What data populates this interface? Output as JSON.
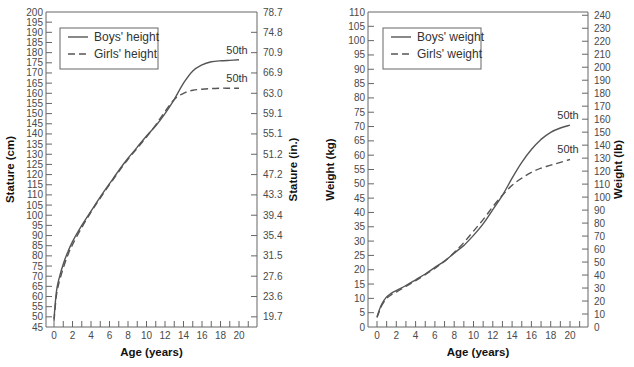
{
  "chart_data": [
    {
      "type": "line",
      "title": "",
      "xlabel": "Age (years)",
      "ylabel": "Stature (cm)",
      "ylabel_right": "Stature (in.)",
      "xlim": [
        0,
        21
      ],
      "ylim": [
        45,
        200
      ],
      "x_ticks": [
        0,
        2,
        4,
        6,
        8,
        10,
        12,
        14,
        16,
        18,
        20
      ],
      "y_ticks": [
        45,
        50,
        55,
        60,
        65,
        70,
        75,
        80,
        85,
        90,
        95,
        100,
        105,
        110,
        115,
        120,
        125,
        130,
        135,
        140,
        145,
        150,
        155,
        160,
        165,
        170,
        175,
        180,
        185,
        190,
        195,
        200
      ],
      "y_ticks_right": [
        {
          "cm": 50,
          "label": "19.7"
        },
        {
          "cm": 60,
          "label": "23.6"
        },
        {
          "cm": 70,
          "label": "27.6"
        },
        {
          "cm": 80,
          "label": "31.5"
        },
        {
          "cm": 90,
          "label": "35.4"
        },
        {
          "cm": 100,
          "label": "39.4"
        },
        {
          "cm": 110,
          "label": "43.3"
        },
        {
          "cm": 120,
          "label": "47.2"
        },
        {
          "cm": 130,
          "label": "51.2"
        },
        {
          "cm": 140,
          "label": "55.1"
        },
        {
          "cm": 150,
          "label": "59.1"
        },
        {
          "cm": 160,
          "label": "63.0"
        },
        {
          "cm": 170,
          "label": "66.9"
        },
        {
          "cm": 180,
          "label": "70.9"
        },
        {
          "cm": 190,
          "label": "74.8"
        },
        {
          "cm": 200,
          "label": "78.7"
        }
      ],
      "legend": {
        "position": "upper left",
        "entries": [
          {
            "label": "Boys' height",
            "style": "solid"
          },
          {
            "label": "Girls' height",
            "style": "dashed"
          }
        ]
      },
      "annotations": [
        {
          "text": "50th",
          "series": "Boys' height"
        },
        {
          "text": "50th",
          "series": "Girls' height"
        }
      ],
      "grid": false,
      "x": [
        0,
        0.25,
        0.5,
        1,
        1.5,
        2,
        3,
        4,
        5,
        6,
        7,
        8,
        9,
        10,
        11,
        12,
        13,
        14,
        15,
        16,
        17,
        18,
        19,
        20
      ],
      "series": [
        {
          "name": "Boys' height",
          "style": "solid",
          "color": "#555555",
          "values": [
            49,
            62,
            68,
            76,
            82,
            87,
            95,
            102,
            109,
            115.5,
            122,
            128,
            133.5,
            139,
            144,
            150,
            157,
            165,
            171,
            174,
            175.5,
            176,
            176.2,
            176.5
          ]
        },
        {
          "name": "Girls' height",
          "style": "dashed",
          "color": "#555555",
          "values": [
            48,
            60,
            66,
            74,
            80.5,
            85.5,
            94,
            101.5,
            108.5,
            115,
            121.5,
            127.5,
            133,
            138.5,
            144.5,
            151,
            157,
            160,
            161.5,
            162,
            162.3,
            162.5,
            162.5,
            162.5
          ]
        }
      ]
    },
    {
      "type": "line",
      "title": "",
      "xlabel": "Age (years)",
      "ylabel": "Weight (kg)",
      "ylabel_right": "Weight (lb)",
      "xlim": [
        0,
        21
      ],
      "ylim": [
        0,
        110
      ],
      "x_ticks": [
        0,
        2,
        4,
        6,
        8,
        10,
        12,
        14,
        16,
        18,
        20
      ],
      "y_ticks": [
        0,
        5,
        10,
        15,
        20,
        25,
        30,
        35,
        40,
        45,
        50,
        55,
        60,
        65,
        70,
        75,
        80,
        85,
        90,
        95,
        100,
        105,
        110
      ],
      "y_ticks_right": [
        0,
        10,
        20,
        30,
        40,
        50,
        60,
        70,
        80,
        90,
        100,
        110,
        120,
        130,
        140,
        150,
        160,
        170,
        180,
        190,
        200,
        210,
        220,
        230,
        240
      ],
      "legend": {
        "position": "upper left",
        "entries": [
          {
            "label": "Boys' weight",
            "style": "solid"
          },
          {
            "label": "Girls' weight",
            "style": "dashed"
          }
        ]
      },
      "annotations": [
        {
          "text": "50th",
          "series": "Boys' weight"
        },
        {
          "text": "50th",
          "series": "Girls' weight"
        }
      ],
      "grid": false,
      "x": [
        0,
        0.25,
        0.5,
        1,
        1.5,
        2,
        3,
        4,
        5,
        6,
        7,
        8,
        9,
        10,
        11,
        12,
        13,
        14,
        15,
        16,
        17,
        18,
        19,
        20
      ],
      "series": [
        {
          "name": "Boys' weight",
          "style": "solid",
          "color": "#555555",
          "values": [
            3.5,
            6,
            8,
            10.5,
            11.8,
            12.7,
            14.5,
            16.5,
            18.5,
            20.8,
            23,
            25.8,
            28.5,
            32,
            36,
            41,
            46,
            52,
            57.5,
            62,
            65.5,
            68,
            69.5,
            70.5
          ]
        },
        {
          "name": "Girls' weight",
          "style": "dashed",
          "color": "#555555",
          "values": [
            3.3,
            5.5,
            7.5,
            10,
            11.3,
            12.2,
            14.2,
            16.2,
            18.3,
            20.5,
            23,
            26,
            29.5,
            33.5,
            37.5,
            42,
            46,
            49.5,
            52,
            54,
            55.5,
            56.5,
            57.5,
            58.5
          ]
        }
      ]
    }
  ]
}
